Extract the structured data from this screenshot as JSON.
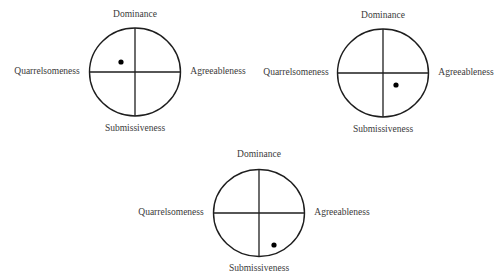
{
  "diagram": {
    "type": "interpersonal-circumplex",
    "axes": {
      "top": "Dominance",
      "bottom": "Submissiveness",
      "left": "Quarrelsomeness",
      "right": "Agreeableness"
    },
    "panels": [
      {
        "id": "panel-1",
        "center": [
          135,
          72
        ],
        "rx": 45.5,
        "ry": 44,
        "dot": [
          121,
          62
        ],
        "quadrant": "dominant-quarrelsome",
        "labels": {
          "top": {
            "text": "Dominance",
            "pos": [
              135,
              15
            ]
          },
          "bottom": {
            "text": "Submissiveness",
            "pos": [
              135,
              129
            ]
          },
          "left": {
            "text": "Quarrelsomeness",
            "pos": [
              47,
              72
            ]
          },
          "right": {
            "text": "Agreeableness",
            "pos": [
              218,
              72
            ]
          }
        }
      },
      {
        "id": "panel-2",
        "center": [
          383,
          73
        ],
        "rx": 45.5,
        "ry": 44,
        "dot": [
          396,
          85
        ],
        "quadrant": "submissive-agreeable",
        "labels": {
          "top": {
            "text": "Dominance",
            "pos": [
              383,
              16
            ]
          },
          "bottom": {
            "text": "Submissiveness",
            "pos": [
              383,
              130
            ]
          },
          "left": {
            "text": "Quarrelsomeness",
            "pos": [
              296,
              73
            ]
          },
          "right": {
            "text": "Agreeableness",
            "pos": [
              466,
              73
            ]
          }
        }
      },
      {
        "id": "panel-3",
        "center": [
          259,
          213
        ],
        "rx": 45.5,
        "ry": 43.5,
        "dot": [
          274,
          245
        ],
        "quadrant": "submissive-agreeable",
        "labels": {
          "top": {
            "text": "Dominance",
            "pos": [
              259,
              155
            ]
          },
          "bottom": {
            "text": "Submissiveness",
            "pos": [
              259,
              269
            ]
          },
          "left": {
            "text": "Quarrelsomeness",
            "pos": [
              171,
              213
            ]
          },
          "right": {
            "text": "Agreeableness",
            "pos": [
              342,
              213
            ]
          }
        }
      }
    ]
  }
}
